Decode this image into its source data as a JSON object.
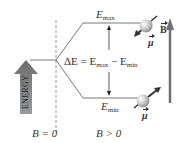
{
  "figure": {
    "energy_label": "ENERGY",
    "b_zero_label": "B = 0",
    "b_positive_label": "B > 0",
    "e_max": {
      "symbol": "E",
      "sub": "max"
    },
    "e_min": {
      "symbol": "E",
      "sub": "min"
    },
    "delta_e": {
      "lhs": "ΔE = E",
      "max_sub": "max",
      "minus": " − E",
      "min_sub": "min"
    },
    "mu_label": "μ",
    "b_field_label": "B",
    "colors": {
      "line": "#555555",
      "dashed": "#999999",
      "energy_arrow": "#8a8a8a",
      "b_arrow": "#707070",
      "sphere": "#c8c8c8",
      "text": "#333333"
    }
  }
}
